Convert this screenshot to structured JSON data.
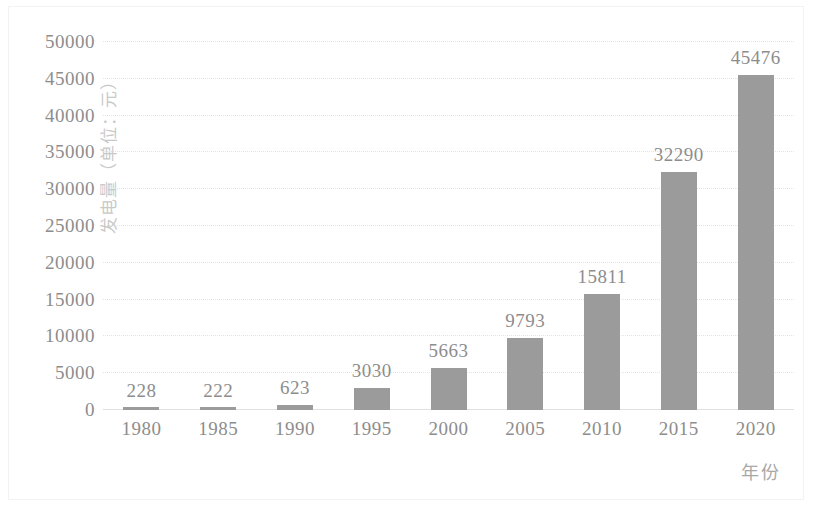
{
  "chart_data": {
    "type": "bar",
    "title": "",
    "subtitle": "",
    "xlabel": "年份",
    "ylabel": "发电量（单位：元）",
    "categories": [
      "1980",
      "1985",
      "1990",
      "1995",
      "2000",
      "2005",
      "2010",
      "2015",
      "2020"
    ],
    "values": [
      228,
      222,
      623,
      3030,
      5663,
      9793,
      15811,
      32290,
      45476
    ],
    "data_labels": [
      "228",
      "222",
      "623",
      "3030",
      "5663",
      "9793",
      "15811",
      "32290",
      "45476"
    ],
    "series": [
      {
        "name": "发电量",
        "values": [
          228,
          222,
          623,
          3030,
          5663,
          9793,
          15811,
          32290,
          45476
        ]
      }
    ],
    "ylim": [
      0,
      50000
    ],
    "ytick_values": [
      0,
      5000,
      10000,
      15000,
      20000,
      25000,
      30000,
      35000,
      40000,
      45000,
      50000
    ],
    "ytick_labels": [
      "0",
      "5000",
      "10000",
      "15000",
      "20000",
      "25000",
      "30000",
      "35000",
      "40000",
      "45000",
      "50000"
    ],
    "grid": true,
    "grid_axis": "y",
    "grid_style": "dotted",
    "legend": false,
    "legend_position": "none",
    "bar_color": "#9b9b9b",
    "text_color": "#8d8d8d",
    "gridline_color": "#e4e4e4",
    "background_color": "#ffffff"
  }
}
